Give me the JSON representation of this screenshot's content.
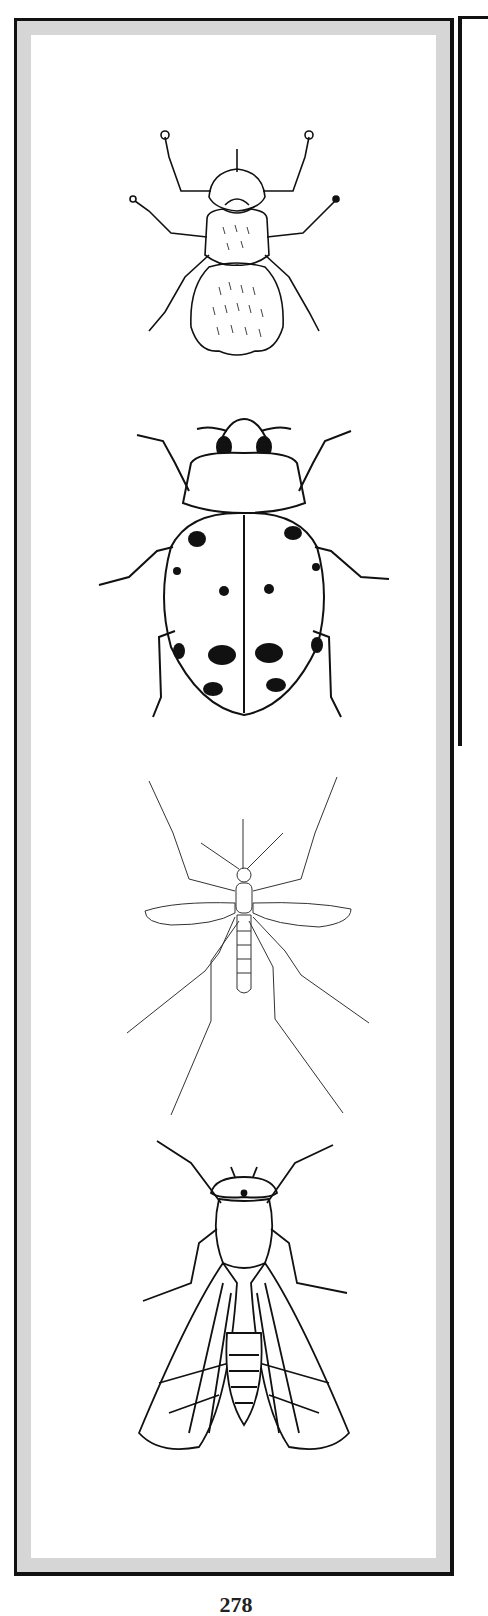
{
  "page": {
    "type": "illustration plate",
    "page_number": "278"
  },
  "panel": {
    "frame_color": "#111111",
    "mat_color": "#d6d6d6",
    "background": "#ffffff"
  },
  "illustrations": [
    {
      "name": "louse",
      "icon": "louse-icon"
    },
    {
      "name": "ladybug",
      "icon": "ladybug-icon",
      "spots": 12
    },
    {
      "name": "mosquito",
      "icon": "mosquito-icon"
    },
    {
      "name": "fly",
      "icon": "fly-icon"
    }
  ]
}
